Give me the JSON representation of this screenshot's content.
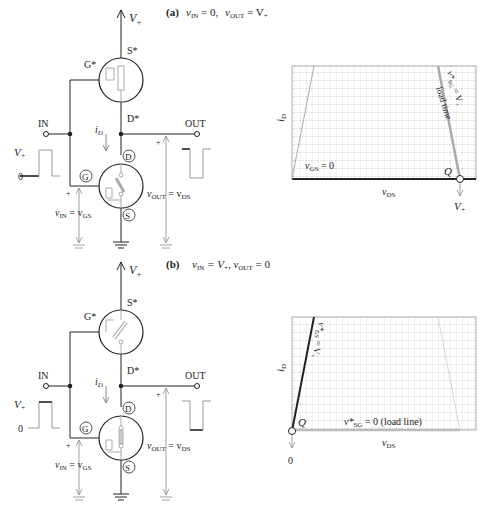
{
  "panel_a": {
    "caption_label": "(a)",
    "caption_vin": "v",
    "caption_vin_sub": "IN",
    "caption_vin_val": " = 0,",
    "caption_vout": "v",
    "caption_vout_sub": "OUT",
    "caption_vout_val": " = V",
    "caption_vout_val_sub": "+",
    "supply_label": "V",
    "supply_sub": "+",
    "p_source": "S*",
    "p_gate": "G*",
    "p_drain": "D*",
    "n_drain": "D",
    "n_gate": "G",
    "n_source": "S",
    "in_label": "IN",
    "out_label": "OUT",
    "current": "i",
    "current_sub": "D",
    "in_wave_high": "V",
    "in_wave_high_sub": "+",
    "in_wave_low": "0",
    "vin_eq": "v",
    "vin_eq_sub1": "IN",
    "vin_eq_mid": " = v",
    "vin_eq_sub2": "GS",
    "vout_eq": "v",
    "vout_eq_sub1": "OUT",
    "vout_eq_mid": " = v",
    "vout_eq_sub2": "DS",
    "plus": "+",
    "chart": {
      "ylabel": "i",
      "ylabel_sub": "D",
      "xlabel": "v",
      "xlabel_sub": "DS",
      "curve_label": "v",
      "curve_label_sub": "GS",
      "curve_label_val": " = 0",
      "load_label_v": "v*",
      "load_label_sub": "SG",
      "load_label_val": " = V",
      "load_label_val_sub": "+",
      "load_line_text": "load time",
      "q_label": "Q",
      "q_value": "V",
      "q_value_sub": "+"
    }
  },
  "panel_b": {
    "caption_label": "(b)",
    "caption_vin": "v",
    "caption_vin_sub": "IN",
    "caption_vin_val": " = V",
    "caption_vin_val_sub": "+",
    "caption_vout": ",  v",
    "caption_vout_sub": "OUT",
    "caption_vout_val": " = 0",
    "supply_label": "V",
    "supply_sub": "+",
    "p_source": "S*",
    "p_gate": "G*",
    "p_drain": "D*",
    "n_drain": "D",
    "n_gate": "G",
    "n_source": "S",
    "in_label": "IN",
    "out_label": "OUT",
    "current": "i",
    "current_sub": "D",
    "in_wave_high": "V",
    "in_wave_high_sub": "+",
    "in_wave_low": "0",
    "vin_eq": "v",
    "vin_eq_sub1": "IN",
    "vin_eq_mid": " = v",
    "vin_eq_sub2": "GS",
    "vout_eq": "v",
    "vout_eq_sub1": "OUT",
    "vout_eq_mid": " = v",
    "vout_eq_sub2": "DS",
    "plus": "+",
    "chart": {
      "ylabel": "i",
      "ylabel_sub": "D",
      "xlabel": "v",
      "xlabel_sub": "DS",
      "curve_label": "v*",
      "curve_label_sub": "GS",
      "curve_label_val": " = V",
      "curve_label_val_sub": "+",
      "load_label_v": "v*",
      "load_label_sub": "SG",
      "load_label_val": " = 0  (load line)",
      "q_label": "Q",
      "q_value": "0"
    }
  },
  "colors": {
    "line": "#222222",
    "gray": "#9a9a9a",
    "light_gray": "#bdbdbd",
    "grid": "#b8b8b8"
  }
}
